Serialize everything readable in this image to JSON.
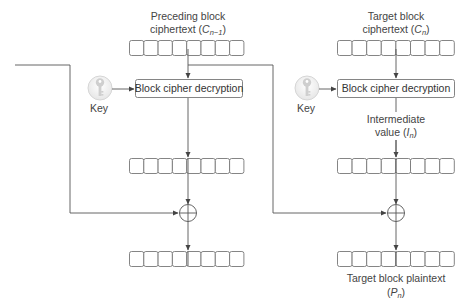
{
  "diagram": {
    "colors": {
      "line": "#555555",
      "cell_stroke": "#777777",
      "key_fill": "#d0d0d0",
      "text": "#444444"
    },
    "left_column": {
      "top_label_line1": "Preceding block",
      "top_label_line2": "ciphertext (",
      "top_label_var": "C",
      "top_label_sub": "n−1",
      "top_label_close": ")",
      "cell_count": 8,
      "decryption_box_label": "Block cipher decryption",
      "key_label": "Key"
    },
    "right_column": {
      "top_label_line1": "Target block",
      "top_label_line2": "ciphertext (",
      "top_label_var": "C",
      "top_label_sub": "n",
      "top_label_close": ")",
      "cell_count": 8,
      "decryption_box_label": "Block cipher decryption",
      "key_label": "Key",
      "intermediate_label_line1": "Intermediate",
      "intermediate_label_line2": "value (",
      "intermediate_label_var": "I",
      "intermediate_label_sub": "n",
      "intermediate_label_close": ")",
      "bottom_label_line1": "Target block plaintext",
      "bottom_label_open": "(",
      "bottom_label_var": "P",
      "bottom_label_sub": "n",
      "bottom_label_close": ")"
    },
    "operators": {
      "xor_symbol": "⊕"
    }
  }
}
